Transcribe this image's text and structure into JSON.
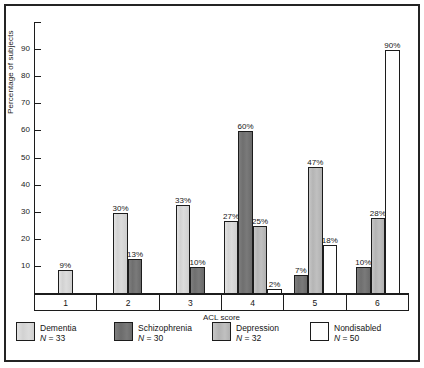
{
  "chart_data": {
    "type": "bar",
    "title": "",
    "xlabel": "ACL score",
    "ylabel": "Percentage of subjects",
    "categories": [
      "1",
      "2",
      "3",
      "4",
      "5",
      "6"
    ],
    "ylim": [
      0,
      100
    ],
    "yticks": [
      10,
      20,
      30,
      40,
      50,
      60,
      70,
      80,
      90
    ],
    "grid": false,
    "legend_position": "bottom",
    "series": [
      {
        "name": "Dementia",
        "n_label": "N = 33",
        "n_prefix": "N",
        "n_value": "= 33",
        "color": "#d6d6d6",
        "key": "dementia",
        "values": [
          9,
          30,
          33,
          27,
          null,
          null
        ],
        "labels": [
          "9%",
          "30%",
          "33%",
          "27%",
          "",
          ""
        ]
      },
      {
        "name": "Schizophrenia",
        "n_label": "N = 30",
        "n_prefix": "N",
        "n_value": "= 30",
        "color": "#737373",
        "key": "schizophrenia",
        "values": [
          null,
          13,
          10,
          60,
          7,
          10
        ],
        "labels": [
          "",
          "13%",
          "10%",
          "60%",
          "7%",
          "10%"
        ]
      },
      {
        "name": "Depression",
        "n_label": "N = 32",
        "n_prefix": "N",
        "n_value": "= 32",
        "color": "#bcbcbc",
        "key": "depression",
        "values": [
          null,
          null,
          null,
          25,
          47,
          28
        ],
        "labels": [
          "",
          "",
          "",
          "25%",
          "47%",
          "28%"
        ]
      },
      {
        "name": "Nondisabled",
        "n_label": "N = 50",
        "n_prefix": "N",
        "n_value": "= 50",
        "color": "#ffffff",
        "key": "nondisabled",
        "values": [
          null,
          null,
          null,
          2,
          18,
          90
        ],
        "labels": [
          "",
          "",
          "",
          "2%",
          "18%",
          "90%"
        ]
      }
    ]
  }
}
